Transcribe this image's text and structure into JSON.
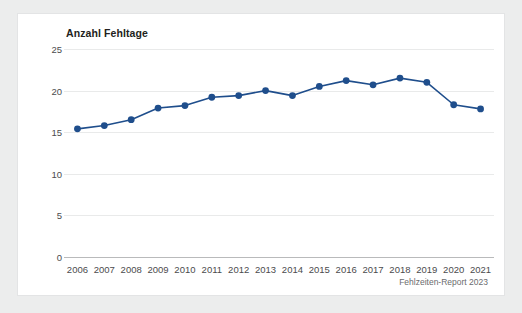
{
  "card": {
    "title": "Anzahl Fehltage",
    "footer_note": "Fehlzeiten-Report 2023"
  },
  "chart_data": {
    "type": "line",
    "title": "Anzahl Fehltage",
    "xlabel": "",
    "ylabel": "",
    "categories": [
      "2006",
      "2007",
      "2008",
      "2009",
      "2010",
      "2011",
      "2012",
      "2013",
      "2014",
      "2015",
      "2016",
      "2017",
      "2018",
      "2019",
      "2020",
      "2021"
    ],
    "values": [
      15.4,
      15.8,
      16.5,
      17.9,
      18.2,
      19.2,
      19.4,
      20.0,
      19.4,
      20.5,
      21.2,
      20.7,
      21.5,
      21.0,
      18.3,
      17.8
    ],
    "ylim": [
      0,
      25
    ],
    "yticks": [
      0,
      5,
      10,
      15,
      20,
      25
    ],
    "grid": true,
    "legend": "none",
    "series_color": "#1f4e8c",
    "marker": "circle",
    "annotation": "Fehlzeiten-Report 2023"
  },
  "colors": {
    "page_background": "#eceded",
    "card_background": "#ffffff",
    "card_border": "#e3e4e5",
    "series": "#1f4e8c",
    "gridline": "#e9eaea",
    "axis": "#b9babb",
    "tick_text": "#4b4b4d",
    "title_text": "#231f20",
    "footer_text": "#6a6b6d"
  }
}
